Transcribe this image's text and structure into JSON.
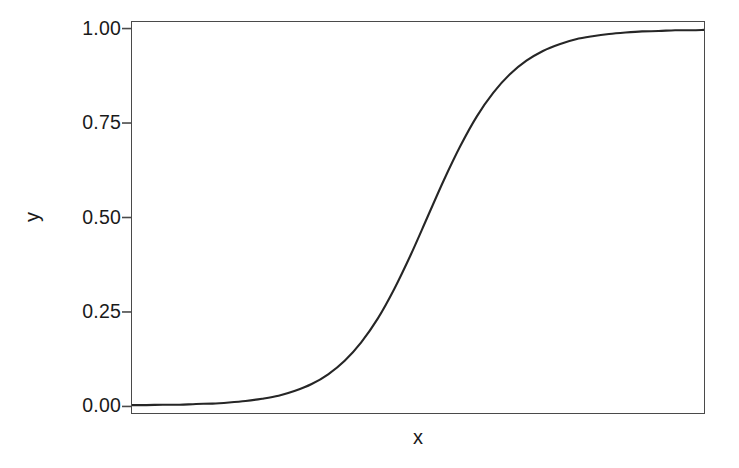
{
  "chart_data": {
    "type": "line",
    "title": "",
    "subtitle": "",
    "xlabel": "x",
    "ylabel": "y",
    "legend": [],
    "legend_position": "none",
    "grid": false,
    "background_color": "#ffffff",
    "panel_border_color": "#4a4a4a",
    "line_color": "#262626",
    "line_width": 2.1,
    "xlim": [
      -7.15,
      6.7
    ],
    "ylim": [
      -0.02,
      1.02
    ],
    "x_ticks": [],
    "x_tick_labels": [],
    "y_ticks": [
      0.0,
      0.25,
      0.5,
      0.75,
      1.0
    ],
    "y_tick_labels": [
      "0.00",
      "0.25",
      "0.50",
      "0.75",
      "1.00"
    ],
    "series": [
      {
        "name": "sigmoid",
        "x": [
          -7.15,
          -6.8,
          -6.4,
          -6.0,
          -5.6,
          -5.2,
          -4.8,
          -4.4,
          -4.0,
          -3.6,
          -3.2,
          -2.8,
          -2.4,
          -2.0,
          -1.6,
          -1.2,
          -0.8,
          -0.4,
          0.0,
          0.4,
          0.8,
          1.2,
          1.6,
          2.0,
          2.4,
          2.8,
          3.2,
          3.6,
          4.0,
          4.4,
          4.8,
          5.2,
          5.6,
          6.0,
          6.4,
          6.7
        ],
        "y": [
          0.001,
          0.001,
          0.002,
          0.002,
          0.004,
          0.005,
          0.008,
          0.012,
          0.018,
          0.026,
          0.039,
          0.057,
          0.083,
          0.119,
          0.168,
          0.231,
          0.31,
          0.401,
          0.5,
          0.599,
          0.69,
          0.769,
          0.832,
          0.881,
          0.917,
          0.943,
          0.961,
          0.974,
          0.982,
          0.988,
          0.992,
          0.995,
          0.996,
          0.998,
          0.998,
          0.999
        ]
      }
    ],
    "reference_points": [
      {
        "label": "y = 0.25",
        "y": 0.25
      },
      {
        "label": "y = 0.50",
        "y": 0.5
      },
      {
        "label": "y = 0.75",
        "y": 0.75
      }
    ]
  },
  "axes": {
    "y_label": "y",
    "x_label": "x",
    "y_tick_labels": [
      "0.00",
      "0.25",
      "0.50",
      "0.75",
      "1.00"
    ]
  }
}
